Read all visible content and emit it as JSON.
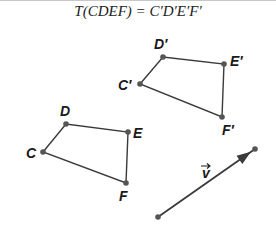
{
  "title": "T(CDEF) = C′D′E′F′",
  "colors": {
    "stroke": "#3a3a3a",
    "point": "#555555",
    "label": "#1a1a1a"
  },
  "original": {
    "points": [
      {
        "name": "C",
        "x": 43,
        "y": 152,
        "lx": 26,
        "ly": 158
      },
      {
        "name": "D",
        "x": 66,
        "y": 124,
        "lx": 60,
        "ly": 116
      },
      {
        "name": "E",
        "x": 128,
        "y": 132,
        "lx": 133,
        "ly": 138
      },
      {
        "name": "F",
        "x": 126,
        "y": 183,
        "lx": 119,
        "ly": 201
      }
    ]
  },
  "image": {
    "points": [
      {
        "name": "C′",
        "x": 140,
        "y": 84,
        "lx": 118,
        "ly": 90
      },
      {
        "name": "D′",
        "x": 163,
        "y": 57,
        "lx": 154,
        "ly": 49
      },
      {
        "name": "E′",
        "x": 224,
        "y": 64,
        "lx": 230,
        "ly": 66
      },
      {
        "name": "F′",
        "x": 222,
        "y": 117,
        "lx": 222,
        "ly": 135
      }
    ]
  },
  "vector": {
    "label": "v",
    "x1": 158,
    "y1": 217,
    "x2": 255,
    "y2": 149,
    "lx": 202,
    "ly": 178
  }
}
